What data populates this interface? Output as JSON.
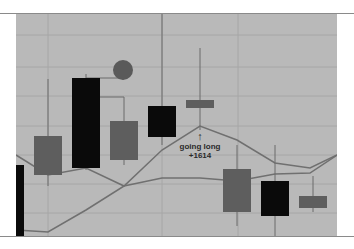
{
  "chart_data": {
    "type": "candlestick",
    "title": "",
    "xlabel": "",
    "ylabel": "",
    "grid": true,
    "legend": null,
    "background_color": "#b9b9b9",
    "colors": {
      "bearish": "#0a0a0a",
      "bullish": "#5e5e5e",
      "line": "#707070",
      "marker": "#5a5a5a"
    },
    "candles": [
      {
        "index": 0,
        "x": 20,
        "open_y": 165,
        "close_y": 236,
        "high_y": 165,
        "low_y": 236,
        "color": "bearish",
        "partial": true
      },
      {
        "index": 1,
        "x": 48,
        "open_y": 136,
        "close_y": 175,
        "high_y": 79,
        "low_y": 186,
        "color": "bullish"
      },
      {
        "index": 2,
        "x": 86,
        "open_y": 78,
        "close_y": 168,
        "high_y": 74,
        "low_y": 170,
        "color": "bearish"
      },
      {
        "index": 3,
        "x": 124,
        "open_y": 121,
        "close_y": 160,
        "high_y": 97,
        "low_y": 165,
        "color": "bullish"
      },
      {
        "index": 4,
        "x": 162,
        "open_y": 106,
        "close_y": 137,
        "high_y": 14,
        "low_y": 145,
        "color": "bearish"
      },
      {
        "index": 5,
        "x": 200,
        "open_y": 100,
        "close_y": 108,
        "high_y": 48,
        "low_y": 130,
        "color": "bullish"
      },
      {
        "index": 6,
        "x": 237,
        "open_y": 169,
        "close_y": 212,
        "high_y": 145,
        "low_y": 226,
        "color": "bullish"
      },
      {
        "index": 7,
        "x": 275,
        "open_y": 181,
        "close_y": 216,
        "high_y": 145,
        "low_y": 236,
        "color": "bearish"
      },
      {
        "index": 8,
        "x": 313,
        "open_y": 196,
        "close_y": 208,
        "high_y": 176,
        "low_y": 212,
        "color": "bullish"
      }
    ],
    "lines": [
      {
        "name": "upper-line",
        "points": [
          [
            16,
            155
          ],
          [
            48,
            175
          ],
          [
            86,
            168
          ],
          [
            124,
            186
          ],
          [
            162,
            150
          ],
          [
            200,
            126
          ],
          [
            237,
            140
          ],
          [
            275,
            163
          ],
          [
            310,
            168
          ],
          [
            337,
            155
          ]
        ]
      },
      {
        "name": "lower-line",
        "points": [
          [
            16,
            230
          ],
          [
            48,
            232
          ],
          [
            86,
            210
          ],
          [
            124,
            186
          ],
          [
            162,
            178
          ],
          [
            200,
            178
          ],
          [
            237,
            181
          ],
          [
            275,
            174
          ],
          [
            310,
            173
          ],
          [
            337,
            155
          ]
        ]
      }
    ],
    "markers": [
      {
        "type": "circle",
        "x": 123,
        "y": 70,
        "r": 10,
        "connected_to_candle": 2
      }
    ],
    "annotations": [
      {
        "text_line1": "going long",
        "text_line2": "+1614",
        "arrow": "up",
        "x": 200,
        "y": 140
      }
    ],
    "gridlines": {
      "horizontal_y": [
        35,
        67,
        96,
        126,
        155,
        184,
        213
      ],
      "vertical_x": [
        48,
        162,
        238
      ]
    }
  },
  "annotation": {
    "line1": "going long",
    "line2": "+1614",
    "arrow": "↑"
  }
}
